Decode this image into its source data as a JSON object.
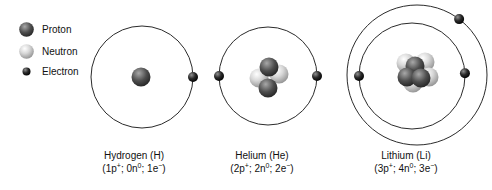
{
  "legend": {
    "items": [
      {
        "id": "proton",
        "label": "Proton"
      },
      {
        "id": "neutron",
        "label": "Neutron"
      },
      {
        "id": "electron",
        "label": "Electron"
      }
    ]
  },
  "atoms": [
    {
      "id": "hydrogen",
      "title": "Hydrogen (H)",
      "formula": "(1p^+; 0n^0; 1e^−)",
      "protons": 1,
      "neutrons": 0,
      "electrons": 1,
      "layout": {
        "cx": 142,
        "cy": 77,
        "label_x": 134,
        "shells": [
          {
            "r": 51,
            "electron_angles": [
              0
            ]
          }
        ],
        "nucleus": [
          {
            "type": "proton",
            "dx": -1,
            "dy": 0
          }
        ]
      }
    },
    {
      "id": "helium",
      "title": "Helium (He)",
      "formula": "(2p^+; 2n^0; 2e^−)",
      "protons": 2,
      "neutrons": 2,
      "electrons": 2,
      "layout": {
        "cx": 268,
        "cy": 76,
        "label_x": 262,
        "shells": [
          {
            "r": 49,
            "electron_angles": [
              180,
              0
            ]
          }
        ],
        "nucleus": [
          {
            "type": "neutron",
            "dx": -9,
            "dy": 2
          },
          {
            "type": "neutron",
            "dx": 11,
            "dy": -2
          },
          {
            "type": "proton",
            "dx": 1,
            "dy": -9
          },
          {
            "type": "proton",
            "dx": 0,
            "dy": 12
          }
        ]
      }
    },
    {
      "id": "lithium",
      "title": "Lithium (Li)",
      "formula": "(3p^+; 4n^0; 3e^−)",
      "protons": 3,
      "neutrons": 4,
      "electrons": 3,
      "layout": {
        "cx": 417,
        "cy": 75,
        "label_x": 406,
        "shells": [
          {
            "r": 53,
            "dx": -5,
            "dy": 1,
            "electron_angles": [
              180,
              3
            ]
          },
          {
            "r": 70,
            "electron_angles": [
              53
            ]
          }
        ],
        "nucleus": [
          {
            "type": "neutron",
            "dx": -11,
            "dy": -12
          },
          {
            "type": "neutron",
            "dx": 8,
            "dy": -13
          },
          {
            "type": "neutron",
            "dx": 12,
            "dy": 2
          },
          {
            "type": "neutron",
            "dx": -4,
            "dy": 8
          },
          {
            "type": "proton",
            "dx": -2,
            "dy": -9
          },
          {
            "type": "proton",
            "dx": -10,
            "dy": 2
          },
          {
            "type": "proton",
            "dx": 4,
            "dy": 3
          }
        ]
      }
    }
  ],
  "particle_sizes": {
    "nucleon_r": 9.5,
    "electron_r": 5,
    "legend_big_r": 7.3,
    "legend_small_r": 4
  },
  "colors": {
    "proton_hi": "#a8a8a8",
    "proton_mid": "#4e4e4e",
    "proton_edge": "#222222",
    "neutron_hi": "#ffffff",
    "neutron_mid": "#d8d8d8",
    "neutron_edge": "#8f8f8f",
    "electron_hi": "#909090",
    "electron_mid": "#2a2a2a",
    "electron_edge": "#000000",
    "orbit_stroke": "#2b2b2b",
    "background": "#ffffff",
    "text": "#111111"
  }
}
